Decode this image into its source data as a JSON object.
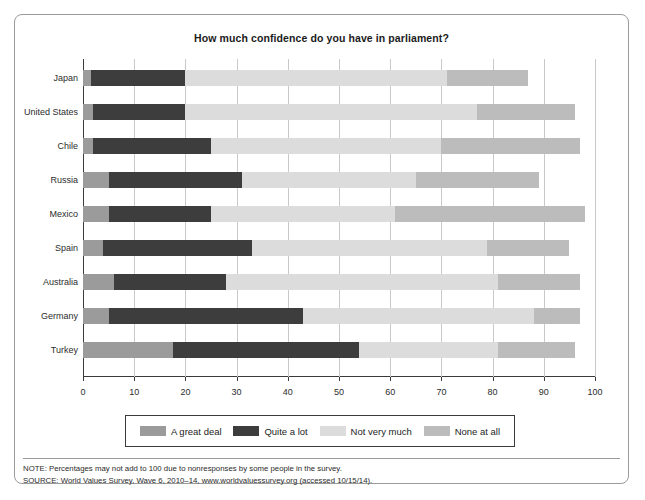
{
  "chart_data": {
    "type": "bar",
    "orientation": "horizontal",
    "stacked": true,
    "title": "How much confidence do you have in parliament?",
    "xlabel": "",
    "ylabel": "",
    "xlim": [
      0,
      100
    ],
    "xticks": [
      0,
      10,
      20,
      30,
      40,
      50,
      60,
      70,
      80,
      90,
      100
    ],
    "grid": true,
    "legend_position": "bottom",
    "categories": [
      "Japan",
      "United States",
      "Chile",
      "Russia",
      "Mexico",
      "Spain",
      "Australia",
      "Germany",
      "Turkey"
    ],
    "series": [
      {
        "name": "A great deal",
        "color": "#9b9b9b",
        "values": [
          1.5,
          2,
          2,
          5,
          5,
          4,
          6,
          5,
          17.5
        ]
      },
      {
        "name": "Quite a lot",
        "color": "#3d3d3d",
        "values": [
          18.5,
          18,
          23,
          26,
          20,
          29,
          22,
          38,
          36.5
        ]
      },
      {
        "name": "Not very much",
        "color": "#dcdcdc",
        "values": [
          51,
          57,
          45,
          34,
          36,
          46,
          53,
          45,
          27
        ]
      },
      {
        "name": "None at all",
        "color": "#bcbcbc",
        "values": [
          16,
          19,
          27,
          24,
          37,
          16,
          16,
          9,
          15
        ]
      }
    ],
    "totals": [
      87,
      96,
      97,
      89,
      98,
      95,
      97,
      97,
      96
    ]
  },
  "notes": {
    "note": "NOTE: Percentages may not add to 100 due to nonresponses by some people in the survey.",
    "source": "SOURCE: World Values Survey, Wave 6, 2010–14, www.worldvaluessurvey.org (accessed 10/15/14)."
  },
  "colors": {
    "axis": "#3a3a3a",
    "grid": "#c9c9c9",
    "frame": "#9a9a9a",
    "text": "#2c2c2c"
  }
}
